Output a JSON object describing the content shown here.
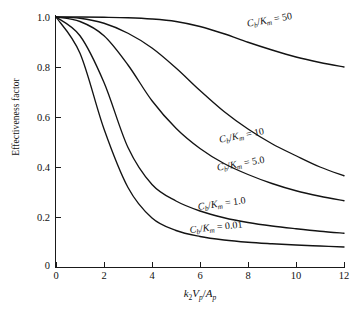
{
  "chart_data": {
    "type": "line",
    "title": "",
    "xlabel": "k2Vp/Ap",
    "ylabel": "Effectiveness factor",
    "xlim": [
      0,
      12
    ],
    "ylim": [
      0,
      1.0
    ],
    "grid": false,
    "legend_position": "inline-curve-labels",
    "x_ticks": [
      "0",
      "2",
      "4",
      "6",
      "8",
      "10",
      "12"
    ],
    "x_tick_values": [
      0,
      2,
      4,
      6,
      8,
      10,
      12
    ],
    "y_ticks": [
      "0",
      "0.2",
      "0.4",
      "0.6",
      "0.8",
      "1.0"
    ],
    "y_tick_values": [
      0,
      0.2,
      0.4,
      0.6,
      0.8,
      1.0
    ],
    "x": [
      0,
      1,
      2,
      3,
      4,
      5,
      6,
      7,
      8,
      9,
      10,
      11,
      12
    ],
    "series": [
      {
        "name": "Cb/Km = 50",
        "label_text": "Cb/Km = 50",
        "values": [
          1.0,
          1.0,
          0.999,
          0.997,
          0.992,
          0.982,
          0.962,
          0.933,
          0.899,
          0.868,
          0.84,
          0.818,
          0.8
        ]
      },
      {
        "name": "Cb/Km = 10",
        "label_text": "Cb/Km = 10",
        "values": [
          1.0,
          0.995,
          0.975,
          0.935,
          0.876,
          0.796,
          0.706,
          0.622,
          0.552,
          0.493,
          0.445,
          0.4,
          0.365
        ]
      },
      {
        "name": "Cb/Km = 5.0",
        "label_text": "Cb/Km = 5.0",
        "values": [
          1.0,
          0.982,
          0.925,
          0.808,
          0.665,
          0.555,
          0.474,
          0.414,
          0.37,
          0.334,
          0.305,
          0.283,
          0.265
        ]
      },
      {
        "name": "Cb/Km = 1.0",
        "label_text": "Cb/Km = 1.0",
        "values": [
          1.0,
          0.925,
          0.738,
          0.478,
          0.33,
          0.264,
          0.224,
          0.197,
          0.178,
          0.164,
          0.153,
          0.143,
          0.135
        ]
      },
      {
        "name": "Cb/Km = 0.01",
        "label_text": "Cb/Km = 0.01",
        "values": [
          1.0,
          0.855,
          0.552,
          0.318,
          0.196,
          0.146,
          0.122,
          0.108,
          0.099,
          0.093,
          0.088,
          0.084,
          0.08
        ]
      }
    ]
  },
  "axes": {
    "y_title": "Effectiveness factor",
    "y_ticks": [
      "1.0",
      "0.8",
      "0.6",
      "0.4",
      "0.2",
      "0"
    ],
    "x_ticks": [
      "0",
      "2",
      "4",
      "6",
      "8",
      "10",
      "12"
    ],
    "x_title_parts": {
      "k": "k",
      "k_sub": "2",
      "V": "V",
      "V_sub": "p",
      "slash": "/",
      "A": "A",
      "A_sub": "p"
    }
  },
  "curve_labels": {
    "c50": {
      "num": "C",
      "num_sub": "b",
      "slash": "/",
      "den": "K",
      "den_sub": "m",
      "eq": " = 50"
    },
    "c10": {
      "num": "C",
      "num_sub": "b",
      "slash": "/",
      "den": "K",
      "den_sub": "m",
      "eq": " = 10"
    },
    "c5": {
      "num": "C",
      "num_sub": "b",
      "slash": "/",
      "den": "K",
      "den_sub": "m",
      "eq": " = 5.0"
    },
    "c1": {
      "num": "C",
      "num_sub": "b",
      "slash": "/",
      "den": "K",
      "den_sub": "m",
      "eq": " = 1.0"
    },
    "c001": {
      "num": "C",
      "num_sub": "b",
      "slash": "/",
      "den": "K",
      "den_sub": "m",
      "eq": " = 0.01"
    }
  },
  "colors": {
    "curve": "#131313",
    "axis": "#1a1a1a",
    "background": "#ffffff",
    "text": "#111111"
  }
}
